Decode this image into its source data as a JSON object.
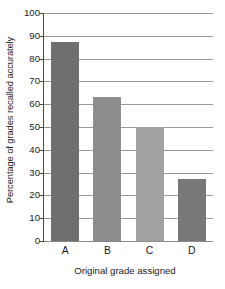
{
  "chart_data": {
    "type": "bar",
    "title": "",
    "subtitle": "",
    "categories": [
      "A",
      "B",
      "C",
      "D"
    ],
    "values": [
      87.5,
      63,
      50,
      27
    ],
    "series": [
      {
        "name": "Percentage of grades recalled accurately",
        "values": [
          87.5,
          63,
          50,
          27
        ]
      }
    ],
    "xlabel": "Original grade assigned",
    "ylabel": "Percentage of grades recalled accurately",
    "ylim": [
      0,
      100
    ],
    "yticks": [
      0,
      10,
      20,
      30,
      40,
      50,
      60,
      70,
      80,
      90,
      100
    ],
    "ytick_labels": [
      "0",
      "10",
      "20",
      "30",
      "40",
      "50",
      "60",
      "70",
      "80",
      "90",
      "100"
    ],
    "grid": true,
    "grid_axis": "y",
    "legend": false,
    "legend_position": "none",
    "bar_colors": [
      "#6f6f6f",
      "#8d8d8d",
      "#a2a2a2",
      "#787878"
    ],
    "background_color": "#ffffff",
    "axis_color": "#4a4a4a",
    "gridline_color": "#9a9a9a",
    "text_color": "#1a1a1a",
    "annotations": []
  },
  "axes": {
    "y_title": "Percentage of grades recalled accurately",
    "x_title": "Original grade assigned"
  }
}
